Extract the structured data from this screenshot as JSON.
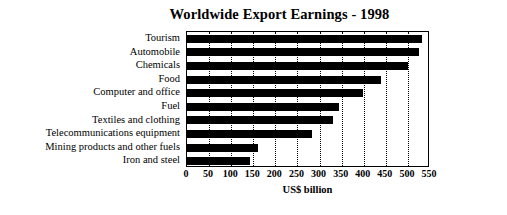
{
  "chart_data": {
    "type": "bar",
    "orientation": "horizontal",
    "title": "Worldwide Export Earnings - 1998",
    "xlabel": "US$ billion",
    "ylabel": "",
    "xlim": [
      0,
      550
    ],
    "xticks": [
      0,
      50,
      100,
      150,
      200,
      250,
      300,
      350,
      400,
      450,
      500,
      550
    ],
    "grid": "vertical-dotted",
    "legend": "none",
    "bar_color": "#000000",
    "categories": [
      "Tourism",
      "Automobile",
      "Chemicals",
      "Food",
      "Computer and office",
      "Fuel",
      "Textiles and clothing",
      "Telecommunications equipment",
      "Mining products and other fuels",
      "Iron and steel"
    ],
    "values": [
      532,
      525,
      500,
      440,
      399,
      345,
      331,
      283,
      160,
      143
    ],
    "series": [
      {
        "name": "Export earnings",
        "values": [
          532,
          525,
          500,
          440,
          399,
          345,
          331,
          283,
          160,
          143
        ]
      }
    ]
  }
}
